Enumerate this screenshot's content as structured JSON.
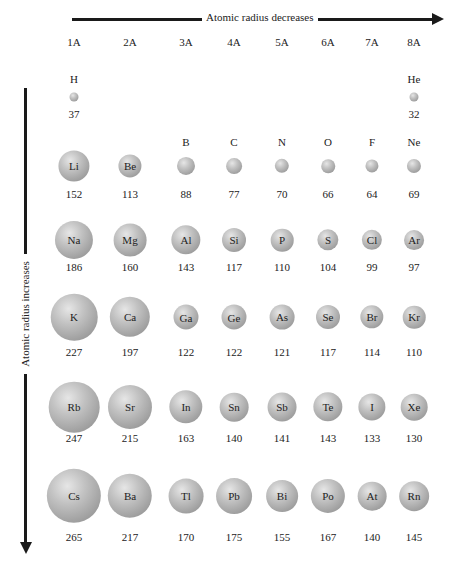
{
  "title_top": "Atomic radius decreases",
  "title_side": "Atomic radius increases",
  "groups": [
    "1A",
    "2A",
    "3A",
    "4A",
    "5A",
    "6A",
    "7A",
    "8A"
  ],
  "colors": {
    "arrow": "#1a1a1a",
    "atom_light": "#e6e6e6",
    "atom_dark": "#8a8a8a"
  },
  "chart_data": {
    "type": "table",
    "columns": [
      "1A",
      "2A",
      "3A",
      "4A",
      "5A",
      "6A",
      "7A",
      "8A"
    ],
    "rows": [
      [
        {
          "s": "H",
          "r": 37
        },
        null,
        null,
        null,
        null,
        null,
        null,
        {
          "s": "He",
          "r": 32
        }
      ],
      [
        {
          "s": "Li",
          "r": 152
        },
        {
          "s": "Be",
          "r": 113
        },
        {
          "s": "B",
          "r": 88
        },
        {
          "s": "C",
          "r": 77
        },
        {
          "s": "N",
          "r": 70
        },
        {
          "s": "O",
          "r": 66
        },
        {
          "s": "F",
          "r": 64
        },
        {
          "s": "Ne",
          "r": 69
        }
      ],
      [
        {
          "s": "Na",
          "r": 186
        },
        {
          "s": "Mg",
          "r": 160
        },
        {
          "s": "Al",
          "r": 143
        },
        {
          "s": "Si",
          "r": 117
        },
        {
          "s": "P",
          "r": 110
        },
        {
          "s": "S",
          "r": 104
        },
        {
          "s": "Cl",
          "r": 99
        },
        {
          "s": "Ar",
          "r": 97
        }
      ],
      [
        {
          "s": "K",
          "r": 227
        },
        {
          "s": "Ca",
          "r": 197
        },
        {
          "s": "Ga",
          "r": 122
        },
        {
          "s": "Ge",
          "r": 122
        },
        {
          "s": "As",
          "r": 121
        },
        {
          "s": "Se",
          "r": 117
        },
        {
          "s": "Br",
          "r": 114
        },
        {
          "s": "Kr",
          "r": 110
        }
      ],
      [
        {
          "s": "Rb",
          "r": 247
        },
        {
          "s": "Sr",
          "r": 215
        },
        {
          "s": "In",
          "r": 163
        },
        {
          "s": "Sn",
          "r": 140
        },
        {
          "s": "Sb",
          "r": 141
        },
        {
          "s": "Te",
          "r": 143
        },
        {
          "s": "I",
          "r": 133
        },
        {
          "s": "Xe",
          "r": 130
        }
      ],
      [
        {
          "s": "Cs",
          "r": 265
        },
        {
          "s": "Ba",
          "r": 217
        },
        {
          "s": "Tl",
          "r": 170
        },
        {
          "s": "Pb",
          "r": 175
        },
        {
          "s": "Bi",
          "r": 155
        },
        {
          "s": "Po",
          "r": 167
        },
        {
          "s": "At",
          "r": 140
        },
        {
          "s": "Rn",
          "r": 145
        }
      ]
    ],
    "annotations": [
      "Atomic radius decreases (left to right)",
      "Atomic radius increases (top to bottom)"
    ]
  }
}
